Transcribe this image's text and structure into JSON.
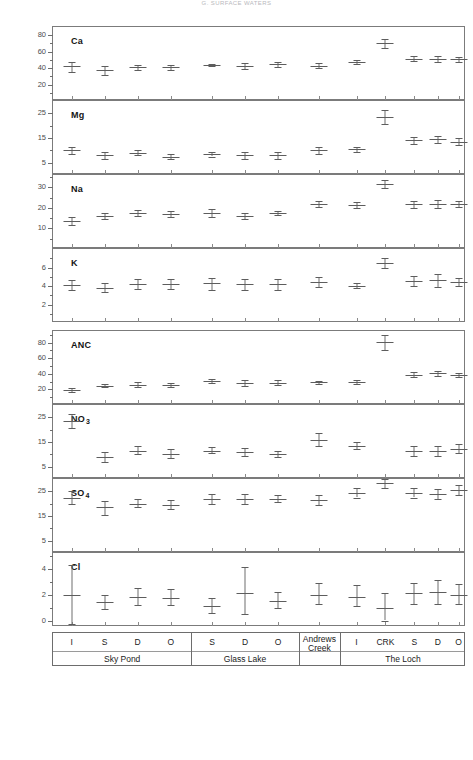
{
  "running_head": "G. SURFACE WATERS",
  "page_number": "",
  "groups": [
    {
      "name": "Sky Pond",
      "codes": [
        "I",
        "S",
        "D",
        "O"
      ]
    },
    {
      "name": "Glass Lake",
      "codes": [
        "S",
        "D",
        "O"
      ]
    },
    {
      "name": "Andrews Creek",
      "codes": [
        ""
      ]
    },
    {
      "name": "The Loch",
      "codes": [
        "I",
        "CRK",
        "S",
        "D",
        "O"
      ]
    }
  ],
  "x_positions": [
    "Sky Pond I",
    "Sky Pond S",
    "Sky Pond D",
    "Sky Pond O",
    "Glass Lake S",
    "Glass Lake D",
    "Glass Lake O",
    "Andrews Creek",
    "The Loch I",
    "The Loch CRK",
    "The Loch S",
    "The Loch D",
    "The Loch O"
  ],
  "chart_data": [
    {
      "type": "scatter",
      "title": "Ca",
      "ylabel": "Ca",
      "xlabel": "",
      "ylim": [
        0,
        90
      ],
      "ticks": [
        20,
        40,
        60,
        80
      ],
      "tick_labels": [
        "20",
        "40",
        "60",
        "80"
      ],
      "minor_ticks": [
        10,
        30,
        50,
        70
      ],
      "grid": false,
      "categories": [
        "Sky Pond I",
        "Sky Pond S",
        "Sky Pond D",
        "Sky Pond O",
        "Glass Lake S",
        "Glass Lake D",
        "Glass Lake O",
        "Andrews Creek",
        "The Loch I",
        "The Loch CRK",
        "The Loch S",
        "The Loch D",
        "The Loch O"
      ],
      "values": [
        42.5,
        37.5,
        41.0,
        41.0,
        43.5,
        43.0,
        44.5,
        43.0,
        47.0,
        70.0,
        51.5,
        51.5,
        50.5
      ],
      "err_low": [
        35.5,
        31.5,
        38.0,
        38.0,
        42.0,
        39.5,
        41.5,
        40.0,
        44.5,
        65.0,
        48.5,
        48.0,
        48.0
      ],
      "err_high": [
        48.0,
        42.5,
        44.0,
        44.0,
        45.0,
        46.5,
        47.5,
        46.0,
        49.5,
        75.0,
        54.5,
        55.0,
        53.0
      ]
    },
    {
      "type": "scatter",
      "title": "Mg",
      "ylabel": "Mg",
      "xlabel": "",
      "ylim": [
        0,
        30
      ],
      "ticks": [
        5,
        15,
        25
      ],
      "tick_labels": [
        "5",
        "15",
        "25"
      ],
      "minor_ticks": [
        10,
        20
      ],
      "grid": false,
      "categories": [
        "Sky Pond I",
        "Sky Pond S",
        "Sky Pond D",
        "Sky Pond O",
        "Glass Lake S",
        "Glass Lake D",
        "Glass Lake O",
        "Andrews Creek",
        "The Loch I",
        "The Loch CRK",
        "The Loch S",
        "The Loch D",
        "The Loch O"
      ],
      "values": [
        10.0,
        8.0,
        9.0,
        7.5,
        8.5,
        8.0,
        8.0,
        10.0,
        10.5,
        23.5,
        14.0,
        14.5,
        13.5
      ],
      "err_low": [
        8.5,
        6.5,
        8.0,
        6.5,
        7.5,
        6.5,
        6.5,
        8.5,
        9.5,
        20.5,
        12.5,
        13.0,
        12.0
      ],
      "err_high": [
        11.5,
        9.5,
        10.0,
        8.5,
        9.5,
        9.5,
        9.5,
        11.5,
        11.5,
        26.5,
        15.5,
        16.0,
        15.0
      ]
    },
    {
      "type": "scatter",
      "title": "Na",
      "ylabel": "Na",
      "xlabel": "",
      "ylim": [
        0,
        36
      ],
      "ticks": [
        10,
        20,
        30
      ],
      "tick_labels": [
        "10",
        "20",
        "30"
      ],
      "minor_ticks": [
        5,
        15,
        25,
        35
      ],
      "grid": false,
      "categories": [
        "Sky Pond I",
        "Sky Pond S",
        "Sky Pond D",
        "Sky Pond O",
        "Glass Lake S",
        "Glass Lake D",
        "Glass Lake O",
        "Andrews Creek",
        "The Loch I",
        "The Loch CRK",
        "The Loch S",
        "The Loch D",
        "The Loch O"
      ],
      "values": [
        13.5,
        16.0,
        17.5,
        17.0,
        17.5,
        16.0,
        17.5,
        22.0,
        21.5,
        31.5,
        22.0,
        22.0,
        22.0
      ],
      "err_low": [
        11.5,
        14.5,
        16.0,
        15.5,
        15.5,
        14.5,
        16.5,
        20.5,
        20.0,
        29.5,
        20.0,
        20.0,
        20.5
      ],
      "err_high": [
        15.5,
        17.5,
        19.0,
        18.5,
        19.5,
        17.5,
        18.5,
        23.5,
        23.0,
        33.5,
        23.5,
        24.0,
        23.5
      ]
    },
    {
      "type": "scatter",
      "title": "K",
      "ylabel": "K",
      "xlabel": "",
      "ylim": [
        0,
        8
      ],
      "ticks": [
        2,
        4,
        6
      ],
      "tick_labels": [
        "2",
        "4",
        "6"
      ],
      "minor_ticks": [
        1,
        3,
        5,
        7
      ],
      "grid": false,
      "categories": [
        "Sky Pond I",
        "Sky Pond S",
        "Sky Pond D",
        "Sky Pond O",
        "Glass Lake S",
        "Glass Lake D",
        "Glass Lake O",
        "Andrews Creek",
        "The Loch I",
        "The Loch CRK",
        "The Loch S",
        "The Loch D",
        "The Loch O"
      ],
      "values": [
        4.1,
        3.8,
        4.2,
        4.2,
        4.3,
        4.2,
        4.2,
        4.4,
        4.0,
        6.5,
        4.5,
        4.6,
        4.4
      ],
      "err_low": [
        3.6,
        3.3,
        3.7,
        3.7,
        3.6,
        3.6,
        3.6,
        3.9,
        3.8,
        6.0,
        4.0,
        3.9,
        4.0
      ],
      "err_high": [
        4.6,
        4.3,
        4.8,
        4.8,
        4.9,
        4.8,
        4.8,
        5.0,
        4.3,
        7.0,
        5.1,
        5.3,
        4.9
      ]
    },
    {
      "type": "scatter",
      "title": "ANC",
      "ylabel": "ANC",
      "xlabel": "",
      "ylim": [
        0,
        95
      ],
      "ticks": [
        20,
        40,
        60,
        80
      ],
      "tick_labels": [
        "20",
        "40",
        "60",
        "80"
      ],
      "minor_ticks": [
        10,
        30,
        50,
        70,
        90
      ],
      "grid": false,
      "categories": [
        "Sky Pond I",
        "Sky Pond S",
        "Sky Pond D",
        "Sky Pond O",
        "Glass Lake S",
        "Glass Lake D",
        "Glass Lake O",
        "Andrews Creek",
        "The Loch I",
        "The Loch CRK",
        "The Loch S",
        "The Loch D",
        "The Loch O"
      ],
      "values": [
        19.0,
        25.0,
        26.0,
        25.5,
        31.0,
        28.0,
        28.5,
        29.0,
        29.5,
        81.0,
        39.0,
        40.5,
        38.0
      ],
      "err_low": [
        17.0,
        22.5,
        23.0,
        23.5,
        28.0,
        24.5,
        25.5,
        27.0,
        27.0,
        71.0,
        35.5,
        37.0,
        35.5
      ],
      "err_high": [
        21.5,
        27.5,
        29.0,
        28.0,
        34.0,
        31.5,
        31.5,
        31.0,
        32.0,
        90.0,
        42.0,
        44.0,
        40.5
      ]
    },
    {
      "type": "scatter",
      "title": "NO3",
      "title_base": "NO",
      "title_sub": "3",
      "ylabel": "NO3",
      "xlabel": "",
      "ylim": [
        0,
        30
      ],
      "ticks": [
        5,
        15,
        25
      ],
      "tick_labels": [
        "5",
        "15",
        "25"
      ],
      "minor_ticks": [
        10,
        20
      ],
      "grid": false,
      "categories": [
        "Sky Pond I",
        "Sky Pond S",
        "Sky Pond D",
        "Sky Pond O",
        "Glass Lake S",
        "Glass Lake D",
        "Glass Lake O",
        "Andrews Creek",
        "The Loch I",
        "The Loch CRK",
        "The Loch S",
        "The Loch D",
        "The Loch O"
      ],
      "values": [
        23.5,
        9.0,
        11.5,
        10.0,
        11.5,
        11.0,
        10.0,
        16.0,
        13.5,
        null,
        11.5,
        11.5,
        12.0
      ],
      "err_low": [
        20.5,
        7.0,
        10.0,
        8.5,
        10.5,
        9.5,
        9.0,
        13.5,
        12.0,
        null,
        9.5,
        9.5,
        10.5
      ],
      "err_high": [
        26.5,
        11.0,
        13.5,
        12.0,
        13.0,
        12.5,
        11.5,
        18.5,
        15.0,
        null,
        13.5,
        13.5,
        14.0
      ]
    },
    {
      "type": "scatter",
      "title": "SO4",
      "title_base": "SO",
      "title_sub": "4",
      "ylabel": "SO4",
      "xlabel": "",
      "ylim": [
        0,
        30
      ],
      "ticks": [
        5,
        15,
        25
      ],
      "tick_labels": [
        "5",
        "15",
        "25"
      ],
      "minor_ticks": [
        10,
        20
      ],
      "grid": false,
      "categories": [
        "Sky Pond I",
        "Sky Pond S",
        "Sky Pond D",
        "Sky Pond O",
        "Glass Lake S",
        "Glass Lake D",
        "Glass Lake O",
        "Andrews Creek",
        "The Loch I",
        "The Loch CRK",
        "The Loch S",
        "The Loch D",
        "The Loch O"
      ],
      "values": [
        22.5,
        18.5,
        20.0,
        19.5,
        22.0,
        22.0,
        22.0,
        21.5,
        24.5,
        28.5,
        24.5,
        24.0,
        25.5
      ],
      "err_low": [
        20.0,
        15.5,
        18.5,
        18.0,
        20.0,
        20.0,
        20.5,
        19.5,
        22.5,
        26.5,
        22.5,
        22.0,
        23.5
      ],
      "err_high": [
        25.0,
        21.0,
        22.0,
        21.5,
        24.0,
        24.0,
        23.5,
        23.5,
        26.5,
        30.5,
        26.5,
        26.0,
        27.5
      ]
    },
    {
      "type": "scatter",
      "title": "Cl",
      "ylabel": "Cl",
      "xlabel": "",
      "ylim": [
        -0.5,
        5.2
      ],
      "ticks": [
        0,
        2,
        4
      ],
      "tick_labels": [
        "0",
        "2",
        "4"
      ],
      "minor_ticks": [
        1,
        3,
        5
      ],
      "grid": false,
      "categories": [
        "Sky Pond I",
        "Sky Pond S",
        "Sky Pond D",
        "Sky Pond O",
        "Glass Lake S",
        "Glass Lake D",
        "Glass Lake O",
        "Andrews Creek",
        "The Loch I",
        "The Loch CRK",
        "The Loch S",
        "The Loch D",
        "The Loch O"
      ],
      "values": [
        2.0,
        1.4,
        1.8,
        1.7,
        1.1,
        2.1,
        1.5,
        2.0,
        1.8,
        1.0,
        2.1,
        2.2,
        2.0
      ],
      "err_low": [
        -0.3,
        0.9,
        1.2,
        1.2,
        0.6,
        0.5,
        1.0,
        1.3,
        1.1,
        0.0,
        1.3,
        1.3,
        1.3
      ],
      "err_high": [
        4.3,
        2.0,
        2.5,
        2.4,
        1.7,
        4.1,
        2.2,
        2.9,
        2.7,
        2.1,
        2.9,
        3.1,
        2.8
      ]
    }
  ]
}
